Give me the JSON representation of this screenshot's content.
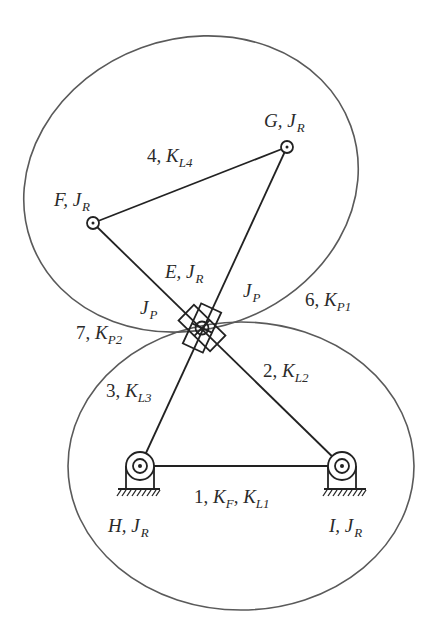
{
  "diagram": {
    "type": "planar-linkage-stiffness-model",
    "joints": [
      {
        "id": "E",
        "label": "E",
        "inertia": "J",
        "inertia_sub": "R",
        "x": 202,
        "y": 328,
        "kind": "double-prismatic-revolute"
      },
      {
        "id": "F",
        "label": "F",
        "inertia": "J",
        "inertia_sub": "R",
        "x": 93,
        "y": 223,
        "kind": "revolute"
      },
      {
        "id": "G",
        "label": "G",
        "inertia": "J",
        "inertia_sub": "R",
        "x": 287,
        "y": 147,
        "kind": "revolute"
      },
      {
        "id": "H",
        "label": "H",
        "inertia": "J",
        "inertia_sub": "R",
        "x": 140,
        "y": 466,
        "kind": "ground-revolute"
      },
      {
        "id": "I",
        "label": "I",
        "inertia": "J",
        "inertia_sub": "R",
        "x": 342,
        "y": 466,
        "kind": "ground-revolute"
      }
    ],
    "links": [
      {
        "num": "1",
        "from": "H",
        "to": "I",
        "stiffness": [
          "K_F",
          "K_L1"
        ]
      },
      {
        "num": "2",
        "from": "E",
        "to": "I",
        "stiffness": [
          "K_L2"
        ]
      },
      {
        "num": "3",
        "from": "E",
        "to": "H",
        "stiffness": [
          "K_L3"
        ]
      },
      {
        "num": "4",
        "from": "F",
        "to": "G",
        "stiffness": [
          "K_L4"
        ]
      },
      {
        "num": "6",
        "element": "upper-loop",
        "stiffness": [
          "K_P1"
        ]
      },
      {
        "num": "7",
        "element": "lower-loop",
        "stiffness": [
          "K_P2"
        ]
      }
    ],
    "prismatic_labels": [
      {
        "text": "J",
        "sub": "P",
        "side": "left"
      },
      {
        "text": "J",
        "sub": "P",
        "side": "right"
      }
    ]
  },
  "labels": {
    "G": {
      "main": "G, J",
      "sub": "R"
    },
    "F": {
      "main": "F, J",
      "sub": "R"
    },
    "E": {
      "main": "E, J",
      "sub": "R"
    },
    "H": {
      "main": "H, J",
      "sub": "R"
    },
    "I": {
      "main": "I, J",
      "sub": "R"
    },
    "link4": {
      "num": "4, ",
      "k": "K",
      "sub": "L4"
    },
    "link2": {
      "num": "2, ",
      "k": "K",
      "sub": "L2"
    },
    "link3": {
      "num": "3, ",
      "k": "K",
      "sub": "L3"
    },
    "link1": {
      "num": "1, ",
      "k1": "K",
      "sub1": "F",
      "sep": ", ",
      "k2": "K",
      "sub2": "L1"
    },
    "loop6": {
      "num": "6, ",
      "k": "K",
      "sub": "P1"
    },
    "loop7": {
      "num": "7, ",
      "k": "K",
      "sub": "P2"
    },
    "jp_left": {
      "main": "J",
      "sub": "P"
    },
    "jp_right": {
      "main": "J",
      "sub": "P"
    }
  },
  "colors": {
    "background": "#ffffff",
    "ink": "#222222",
    "ellipse": "#5a5a5a"
  }
}
